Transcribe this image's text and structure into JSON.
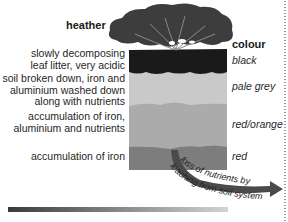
{
  "diagram": {
    "plant_label": "heather",
    "colour_header": "colour",
    "layers": [
      {
        "description_lines": [
          "slowly decomposing",
          "leaf litter, very acidic"
        ],
        "colour": "black",
        "fill": "#1b1b1b"
      },
      {
        "description_lines": [
          "soil broken down, iron and",
          "aluminium washed down",
          "along with nutrients"
        ],
        "colour": "pale grey",
        "fill": "#c8c8c8"
      },
      {
        "description_lines": [
          "accumulation of iron,",
          "aluminium and nutrients"
        ],
        "colour": "red/orange",
        "fill": "#a9a9a9"
      },
      {
        "description_lines": [
          "accumulation of iron"
        ],
        "colour": "red",
        "fill": "#7c7c7c"
      }
    ],
    "arrow_label_line1": "loss of nutrients by",
    "arrow_label_line2": "leaching from soil system",
    "colors": {
      "canopy": "#3c3c3c",
      "arrow": "#4a4a4a",
      "gradient_start": "#3a3a3a",
      "gradient_end": "#d0d0d0"
    }
  }
}
